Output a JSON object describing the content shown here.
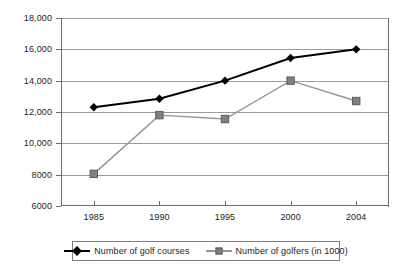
{
  "chart_data": {
    "type": "line",
    "title": "",
    "xlabel": "",
    "ylabel": "",
    "categories": [
      "1985",
      "1990",
      "1995",
      "2000",
      "2004"
    ],
    "ylim": [
      6000,
      18000
    ],
    "ytick_step": 2000,
    "ytick_labels": [
      "18,000",
      "16,000",
      "14,000",
      "12,000",
      "10,000",
      "8000",
      "6000"
    ],
    "ytick_values": [
      18000,
      16000,
      14000,
      12000,
      10000,
      8000,
      6000
    ],
    "grid": true,
    "legend_position": "bottom",
    "series": [
      {
        "name": "Number of golf courses",
        "marker": "diamond",
        "color": "#000000",
        "values": [
          12300,
          12850,
          14000,
          15450,
          16000
        ]
      },
      {
        "name": "Number of golfers (in 1000)",
        "marker": "square",
        "color": "#808080",
        "values": [
          8050,
          11800,
          11550,
          14000,
          12700
        ]
      }
    ]
  },
  "axis": {
    "line_color": "#6b6b6b",
    "grid_color": "#9a9a9a",
    "text_color": "#1c1c1c"
  },
  "legend": {
    "items": [
      {
        "label": "Number of golf courses"
      },
      {
        "label": "Number of golfers (in 1000)"
      }
    ]
  }
}
